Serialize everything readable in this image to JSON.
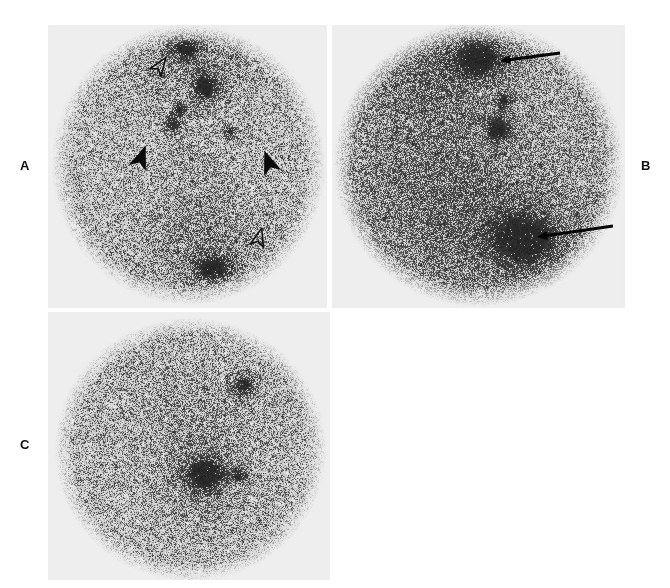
{
  "figure": {
    "type": "medical-imaging-figure",
    "modality": "scintigraphy",
    "background_color": "#ffffff",
    "panel_background_color": "#eeeeee",
    "width": 670,
    "height": 588,
    "panel_count": 3
  },
  "labels": {
    "panel_a": "A",
    "panel_b": "B",
    "panel_c": "C"
  },
  "panels": [
    {
      "id": "panel-a",
      "label": "A",
      "label_position": "left",
      "frame": {
        "x": 48,
        "y": 25,
        "w": 279,
        "h": 283
      },
      "field_of_view": {
        "shape": "circle",
        "cx": 188,
        "cy": 164,
        "rx": 132,
        "ry": 135
      },
      "noise": {
        "density": 0.52,
        "seed": 11,
        "base_gray": "#b9b9b9"
      },
      "hot_spots": [
        {
          "name": "hotspot-superior-midline",
          "cx": 186,
          "cy": 47,
          "rx": 13,
          "ry": 11,
          "intensity": 0.88
        },
        {
          "name": "hotspot-upper-central",
          "cx": 205,
          "cy": 87,
          "rx": 11,
          "ry": 13,
          "intensity": 0.93
        },
        {
          "name": "hotspot-small-left",
          "cx": 179,
          "cy": 110,
          "rx": 7,
          "ry": 7,
          "intensity": 0.72
        },
        {
          "name": "hotspot-small-lower-left",
          "cx": 172,
          "cy": 124,
          "rx": 8,
          "ry": 8,
          "intensity": 0.82
        },
        {
          "name": "hotspot-small-right",
          "cx": 230,
          "cy": 131,
          "rx": 7,
          "ry": 6,
          "intensity": 0.68
        },
        {
          "name": "hotspot-inferior-midline",
          "cx": 212,
          "cy": 268,
          "rx": 17,
          "ry": 12,
          "intensity": 0.86
        },
        {
          "name": "diffuse-superior-band",
          "cx": 195,
          "cy": 60,
          "rx": 75,
          "ry": 42,
          "intensity": 0.3
        },
        {
          "name": "diffuse-inferior-band",
          "cx": 205,
          "cy": 250,
          "rx": 70,
          "ry": 45,
          "intensity": 0.28
        },
        {
          "name": "diffuse-central-column",
          "cx": 198,
          "cy": 175,
          "rx": 42,
          "ry": 70,
          "intensity": 0.16
        }
      ],
      "markers": [
        {
          "name": "open-arrowhead-upper-left",
          "style": "open",
          "x": 160,
          "y": 66,
          "rotation": 35,
          "size": 11
        },
        {
          "name": "open-arrowhead-lower-right",
          "style": "open",
          "x": 259,
          "y": 238,
          "rotation": 15,
          "size": 11
        },
        {
          "name": "solid-arrowhead-left",
          "style": "solid",
          "x": 141,
          "y": 158,
          "rotation": 20,
          "size": 13
        },
        {
          "name": "solid-arrowhead-right",
          "style": "solid",
          "x": 269,
          "y": 163,
          "rotation": -20,
          "size": 13
        }
      ],
      "arrows": []
    },
    {
      "id": "panel-b",
      "label": "B",
      "label_position": "right",
      "frame": {
        "x": 332,
        "y": 25,
        "w": 293,
        "h": 283
      },
      "field_of_view": {
        "shape": "circle",
        "cx": 478,
        "cy": 164,
        "rx": 140,
        "ry": 137
      },
      "noise": {
        "density": 0.7,
        "seed": 29,
        "base_gray": "#8f8f8f"
      },
      "hot_spots": [
        {
          "name": "hotspot-upper-focus",
          "cx": 478,
          "cy": 58,
          "rx": 22,
          "ry": 17,
          "intensity": 0.92
        },
        {
          "name": "hotspot-mid-small",
          "cx": 504,
          "cy": 100,
          "rx": 7,
          "ry": 8,
          "intensity": 0.74
        },
        {
          "name": "hotspot-mid-central",
          "cx": 498,
          "cy": 129,
          "rx": 12,
          "ry": 11,
          "intensity": 0.86
        },
        {
          "name": "hotspot-lower-focus",
          "cx": 524,
          "cy": 240,
          "rx": 27,
          "ry": 22,
          "intensity": 0.95
        },
        {
          "name": "diffuse-left-field",
          "cx": 430,
          "cy": 150,
          "rx": 80,
          "ry": 100,
          "intensity": 0.26
        },
        {
          "name": "diffuse-lower-field",
          "cx": 500,
          "cy": 230,
          "rx": 95,
          "ry": 62,
          "intensity": 0.32
        },
        {
          "name": "diffuse-upper-left",
          "cx": 440,
          "cy": 70,
          "rx": 60,
          "ry": 45,
          "intensity": 0.22
        }
      ],
      "markers": [],
      "arrows": [
        {
          "name": "arrow-upper",
          "x1": 560,
          "y1": 53,
          "x2": 500,
          "y2": 61,
          "thickness": 3.2,
          "head": 9
        },
        {
          "name": "arrow-lower",
          "x1": 613,
          "y1": 226,
          "x2": 537,
          "y2": 237,
          "thickness": 3.2,
          "head": 9
        }
      ]
    },
    {
      "id": "panel-c",
      "label": "C",
      "label_position": "left",
      "frame": {
        "x": 48,
        "y": 312,
        "w": 282,
        "h": 268
      },
      "field_of_view": {
        "shape": "circle",
        "cx": 190,
        "cy": 449,
        "rx": 131,
        "ry": 127
      },
      "noise": {
        "density": 0.55,
        "seed": 47,
        "base_gray": "#adadad"
      },
      "hot_spots": [
        {
          "name": "hotspot-upper-right-focus",
          "cx": 244,
          "cy": 385,
          "rx": 11,
          "ry": 11,
          "intensity": 0.88
        },
        {
          "name": "hotspot-lower-central-focus",
          "cx": 205,
          "cy": 473,
          "rx": 16,
          "ry": 14,
          "intensity": 0.94
        },
        {
          "name": "hotspot-lower-right-small",
          "cx": 239,
          "cy": 476,
          "rx": 8,
          "ry": 7,
          "intensity": 0.66
        },
        {
          "name": "diffuse-central-band",
          "cx": 198,
          "cy": 430,
          "rx": 56,
          "ry": 60,
          "intensity": 0.24
        },
        {
          "name": "diffuse-lower-tail",
          "cx": 202,
          "cy": 490,
          "rx": 38,
          "ry": 32,
          "intensity": 0.26
        }
      ],
      "markers": [],
      "arrows": []
    }
  ],
  "annotations": {
    "solid_arrowhead_meaning": "solid arrowhead marker",
    "open_arrowhead_meaning": "open arrowhead marker",
    "arrow_meaning": "arrow marker"
  }
}
